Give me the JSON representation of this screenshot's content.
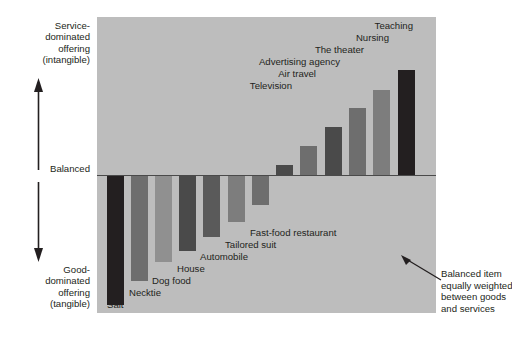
{
  "chart_data": {
    "type": "bar",
    "title": "",
    "subtitle": "",
    "xlabel": "",
    "ylabel": "Service-dominated offering (intangible) to Good-dominated offering (tangible)",
    "orientation": "vertical-diverging",
    "baseline_label": "Balanced",
    "grid": false,
    "legend": "none",
    "ylim": [
      -1,
      1
    ],
    "axis_top_label": "Service-dominated offering (intangible)",
    "axis_mid_label": "Balanced",
    "axis_bottom_label": "Good-dominated offering (tangible)",
    "categories": [
      "Salt",
      "Necktie",
      "Dog food",
      "House",
      "Automobile",
      "Tailored suit",
      "Fast-food restaurant",
      "Television",
      "Air travel",
      "Advertising agency",
      "The theater",
      "Nursing",
      "Teaching"
    ],
    "values": [
      -0.94,
      -0.77,
      -0.63,
      -0.55,
      -0.45,
      -0.34,
      -0.22,
      0.07,
      0.21,
      0.34,
      0.48,
      0.61,
      0.75
    ],
    "note": "Bars extend downward (tangible goods) or upward (intangible services) from the Balanced baseline."
  },
  "axis": {
    "top": {
      "line1": "Service-",
      "line2": "dominated",
      "line3": "offering",
      "line4": "(intangible)"
    },
    "middle": "Balanced",
    "bottom": {
      "line1": "Good-",
      "line2": "dominated",
      "line3": "offering",
      "line4": "(tangible)"
    }
  },
  "bars": [
    {
      "label": "Salt",
      "value": -0.94,
      "color": "#231f20",
      "x": 10,
      "width": 17,
      "align": "left",
      "label_x": 10,
      "label_y": 282
    },
    {
      "label": "Necktie",
      "value": -0.77,
      "color": "#6e6e6e",
      "x": 34,
      "width": 17,
      "align": "left",
      "label_x": 32,
      "label_y": 270
    },
    {
      "label": "Dog food",
      "value": -0.63,
      "color": "#909090",
      "x": 58,
      "width": 17,
      "align": "left",
      "label_x": 55,
      "label_y": 258
    },
    {
      "label": "House",
      "value": -0.55,
      "color": "#4a4a4a",
      "x": 82,
      "width": 17,
      "align": "left",
      "label_x": 80,
      "label_y": 246
    },
    {
      "label": "Automobile",
      "value": -0.45,
      "color": "#5a5a5a",
      "x": 106,
      "width": 17,
      "align": "left",
      "label_x": 103,
      "label_y": 234
    },
    {
      "label": "Tailored suit",
      "value": -0.34,
      "color": "#7d7d7d",
      "x": 131,
      "width": 17,
      "align": "left",
      "label_x": 128,
      "label_y": 222
    },
    {
      "label": "Fast-food restaurant",
      "value": -0.22,
      "color": "#6e6e6e",
      "x": 155,
      "width": 17,
      "align": "left",
      "label_x": 153,
      "label_y": 210
    },
    {
      "label": "Television",
      "value": 0.07,
      "color": "#4a4a4a",
      "x": 179,
      "width": 17,
      "align": "right",
      "label_x": 178,
      "label_y": 63
    },
    {
      "label": "Air travel",
      "value": 0.21,
      "color": "#6e6e6e",
      "x": 203,
      "width": 17,
      "align": "right",
      "label_x": 202,
      "label_y": 51
    },
    {
      "label": "Advertising agency",
      "value": 0.34,
      "color": "#4a4a4a",
      "x": 228,
      "width": 17,
      "align": "right",
      "label_x": 226,
      "label_y": 39
    },
    {
      "label": "The theater",
      "value": 0.48,
      "color": "#6e6e6e",
      "x": 252,
      "width": 17,
      "align": "right",
      "label_x": 250,
      "label_y": 27
    },
    {
      "label": "Nursing",
      "value": 0.61,
      "color": "#7d7d7d",
      "x": 276,
      "width": 17,
      "align": "right",
      "label_x": 275,
      "label_y": 15
    },
    {
      "label": "Teaching",
      "value": 0.75,
      "color": "#231f20",
      "x": 301,
      "width": 17,
      "align": "right",
      "label_x": 299,
      "label_y": 3
    }
  ],
  "callout": {
    "line1": "Balanced item",
    "line2": "equally weighted",
    "line3": "between goods",
    "line4": "and services"
  },
  "colors": {
    "panel_background": "#bdbdbd",
    "page_background": "#ffffff",
    "baseline": "#4a4a4a",
    "text": "#231f20",
    "bar_dark": "#231f20",
    "bar_medium": "#6e6e6e",
    "bar_light": "#909090"
  }
}
